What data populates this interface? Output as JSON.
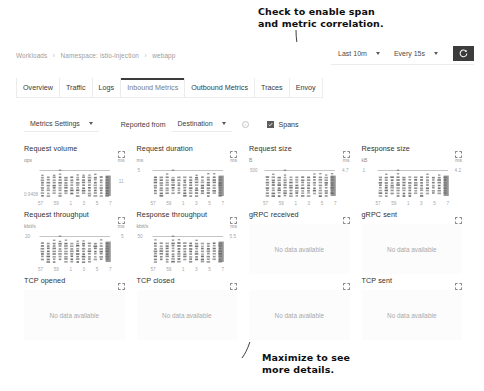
{
  "annotations": {
    "top": "Check to enable span\nand metric correlation.",
    "bottom": "Maximize to see\nmore details."
  },
  "breadcrumb": {
    "items": [
      "Workloads",
      "Namespace: istio-injection",
      "webapp"
    ],
    "separator": "›"
  },
  "timebar": {
    "range_label": "Last 10m",
    "interval_label": "Every 15s",
    "refresh_icon": "refresh-icon"
  },
  "tabs": [
    {
      "label": "Overview",
      "active": false
    },
    {
      "label": "Traffic",
      "active": false
    },
    {
      "label": "Logs",
      "active": false
    },
    {
      "label": "Inbound Metrics",
      "active": true
    },
    {
      "label": "Outbound Metrics",
      "active": false
    },
    {
      "label": "Traces",
      "active": false
    },
    {
      "label": "Envoy",
      "active": false
    }
  ],
  "settings": {
    "metrics_settings_label": "Metrics Settings",
    "reported_from_label": "Reported from",
    "reported_from_value": "Destination",
    "info_icon": "info-icon",
    "spans_label": "Spans",
    "spans_checked": true
  },
  "chart_data": {
    "type": "scatter",
    "xlabel": "",
    "xticks": [
      "57",
      "59",
      "1",
      "3",
      "5",
      "7"
    ],
    "grid": false,
    "legend": null,
    "charts": [
      {
        "title": "Request volume",
        "unit_left": "ops",
        "unit_right": "ms",
        "ymax_left": "",
        "ymin_left": "0.9408",
        "ymax_right": "",
        "ymin_right": "11",
        "has_data": true,
        "series": [
          {
            "name": "request volume",
            "values": [
              0.94,
              0.94,
              0.94,
              0.94,
              0.94,
              0.94,
              0.94,
              0.94,
              0.94,
              0.94,
              0.94,
              0.94
            ]
          }
        ]
      },
      {
        "title": "Request duration",
        "unit_left": "ms",
        "unit_right": "ms",
        "ymax_left": "5",
        "ymin_left": "",
        "ymax_right": "",
        "ymin_right": "",
        "has_data": true,
        "series": [
          {
            "name": "request duration",
            "values": [
              2.1,
              2.0,
              2.2,
              2.1,
              2.0,
              2.3,
              2.1,
              2.0,
              2.2,
              2.1,
              2.0,
              2.4
            ]
          }
        ]
      },
      {
        "title": "Request size",
        "unit_left": "B",
        "unit_right": "ms",
        "ymax_left": "500",
        "ymin_left": "",
        "ymax_right": "4.7",
        "ymin_right": "",
        "has_data": true,
        "series": [
          {
            "name": "request size",
            "values": [
              500,
              500,
              500,
              500,
              500,
              500,
              500,
              500,
              500,
              500,
              500,
              500
            ]
          }
        ]
      },
      {
        "title": "Response size",
        "unit_left": "kB",
        "unit_right": "ms",
        "ymax_left": "1",
        "ymin_left": "",
        "ymax_right": "4.2",
        "ymin_right": "",
        "has_data": true,
        "series": [
          {
            "name": "response size",
            "values": [
              1,
              1,
              1,
              1,
              1,
              1,
              1,
              1,
              1,
              1,
              1,
              1
            ]
          }
        ]
      },
      {
        "title": "Request throughput",
        "unit_left": "kbit/s",
        "unit_right": "ms",
        "ymax_left": "20",
        "ymin_left": "",
        "ymax_right": "5",
        "ymin_right": "",
        "has_data": true,
        "series": [
          {
            "name": "request throughput",
            "values": [
              20,
              20,
              20,
              20,
              20,
              20,
              20,
              20,
              20,
              20,
              20,
              20
            ]
          }
        ]
      },
      {
        "title": "Response throughput",
        "unit_left": "kbit/s",
        "unit_right": "ms",
        "ymax_left": "50",
        "ymin_left": "",
        "ymax_right": "5.5",
        "ymin_right": "",
        "has_data": true,
        "series": [
          {
            "name": "response throughput",
            "values": [
              50,
              50,
              50,
              50,
              50,
              50,
              50,
              50,
              50,
              50,
              50,
              50
            ]
          }
        ]
      },
      {
        "title": "gRPC received",
        "has_data": false,
        "nodata_text": "No data available"
      },
      {
        "title": "gRPC sent",
        "has_data": false,
        "nodata_text": "No data available"
      },
      {
        "title": "TCP opened",
        "has_data": false,
        "nodata_text": "No data available"
      },
      {
        "title": "TCP closed",
        "has_data": false,
        "nodata_text": "No data available"
      },
      {
        "title": "TCP received",
        "has_data": false,
        "nodata_text": "No data available",
        "title_obscured": true
      },
      {
        "title": "TCP sent",
        "has_data": false,
        "nodata_text": "No data available"
      }
    ]
  },
  "colors": {
    "marker": "#6e6e6e",
    "line": "#8a8a8a",
    "text": "#2f2f2f",
    "muted": "#a6a6a6",
    "accent_dark": "#3c3c3c"
  }
}
